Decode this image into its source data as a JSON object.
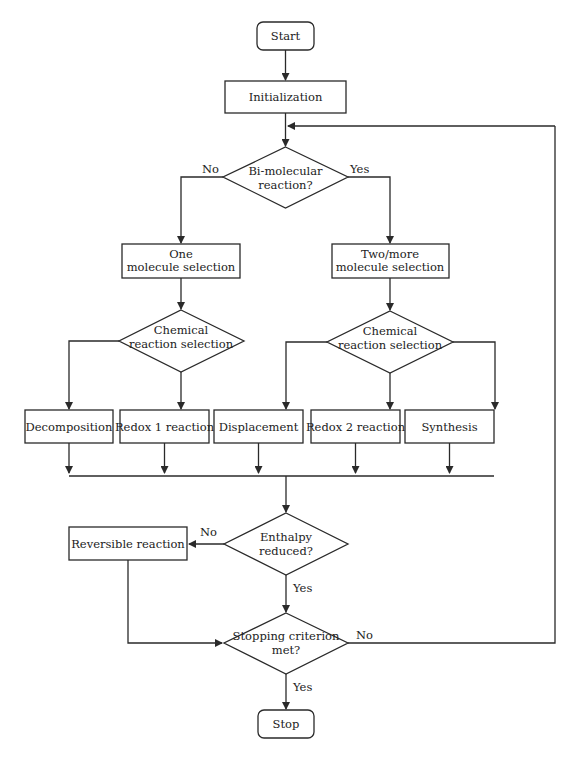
{
  "diagram": {
    "type": "flowchart",
    "nodes": {
      "start": {
        "label": "Start",
        "shape": "terminator"
      },
      "init": {
        "label": "Initialization",
        "shape": "process"
      },
      "bimolecular": {
        "line1": "Bi-molecular",
        "line2": "reaction?",
        "shape": "decision"
      },
      "one_mol": {
        "line1": "One",
        "line2": "molecule selection",
        "shape": "process"
      },
      "two_mol": {
        "line1": "Two/more",
        "line2": "molecule selection",
        "shape": "process"
      },
      "chem_sel_1": {
        "line1": "Chemical",
        "line2": "reaction selection",
        "shape": "decision"
      },
      "chem_sel_2": {
        "line1": "Chemical",
        "line2": "reaction selection",
        "shape": "decision"
      },
      "decomposition": {
        "label": "Decomposition",
        "shape": "process"
      },
      "redox1": {
        "label": "Redox 1 reaction",
        "shape": "process"
      },
      "displacement": {
        "label": "Displacement",
        "shape": "process"
      },
      "redox2": {
        "label": "Redox 2 reaction",
        "shape": "process"
      },
      "synthesis": {
        "label": "Synthesis",
        "shape": "process"
      },
      "enthalpy": {
        "line1": "Enthalpy",
        "line2": "reduced?",
        "shape": "decision"
      },
      "reversible": {
        "label": "Reversible reaction",
        "shape": "process"
      },
      "stopping": {
        "line1": "Stopping criterion",
        "line2": "met?",
        "shape": "decision"
      },
      "stop": {
        "label": "Stop",
        "shape": "terminator"
      }
    },
    "edge_labels": {
      "bimolecular_no": "No",
      "bimolecular_yes": "Yes",
      "enthalpy_no": "No",
      "enthalpy_yes": "Yes",
      "stopping_no": "No",
      "stopping_yes": "Yes"
    },
    "colors": {
      "stroke": "#2a2a2a",
      "fill": "#ffffff",
      "text": "#222222"
    }
  }
}
